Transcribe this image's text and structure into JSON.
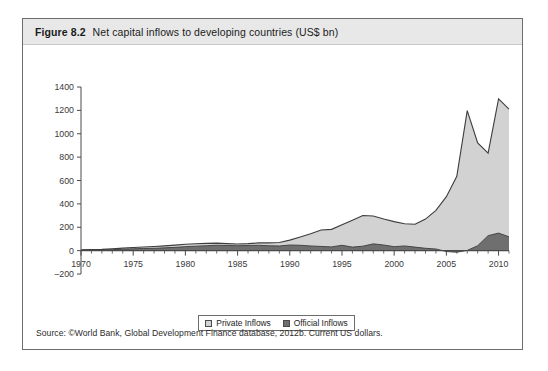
{
  "figure": {
    "number": "Figure 8.2",
    "caption": "Net capital inflows to developing countries (US$ bn)",
    "source": "Source: ©World Bank, Global Development Finance database, 2012b. Current US dollars."
  },
  "legend": {
    "items": [
      {
        "label": "Private Inflows",
        "color": "#d2d2d2"
      },
      {
        "label": "Official Inflows",
        "color": "#6f6f6f"
      }
    ]
  },
  "colors": {
    "private": "#d2d2d2",
    "official": "#6f6f6f",
    "line": "#3d3d3d",
    "axis": "#4a4a4a",
    "title_band": "#e8e8e8",
    "card_border": "#6d6d6d"
  },
  "chart_data": {
    "type": "area",
    "stacked": true,
    "title": "Net capital inflows to developing countries (US$ bn)",
    "xlabel": "",
    "ylabel": "",
    "xlim": [
      1970,
      2011
    ],
    "ylim": [
      -200,
      1400
    ],
    "ytick_step": 200,
    "xtick_step": 5,
    "xtick_minor_step": 1,
    "grid": false,
    "legend_position": "bottom-center",
    "yticks": [
      1400,
      1200,
      1000,
      800,
      600,
      400,
      200,
      0,
      -200
    ],
    "ytick_labels": [
      "1400",
      "1200",
      "1000",
      "800",
      "600",
      "400",
      "200",
      "0",
      "–200"
    ],
    "xticks": [
      1970,
      1975,
      1980,
      1985,
      1990,
      1995,
      2000,
      2005,
      2010
    ],
    "xtick_labels": [
      "1970",
      "1975",
      "1980",
      "1985",
      "1990",
      "1995",
      "2000",
      "2005",
      "2010"
    ],
    "x": [
      1970,
      1971,
      1972,
      1973,
      1974,
      1975,
      1976,
      1977,
      1978,
      1979,
      1980,
      1981,
      1982,
      1983,
      1984,
      1985,
      1986,
      1987,
      1988,
      1989,
      1990,
      1991,
      1992,
      1993,
      1994,
      1995,
      1996,
      1997,
      1998,
      1999,
      2000,
      2001,
      2002,
      2003,
      2004,
      2005,
      2006,
      2007,
      2008,
      2009,
      2010,
      2011
    ],
    "series": [
      {
        "name": "Official Inflows",
        "color": "#6f6f6f",
        "values": [
          4,
          5,
          6,
          8,
          12,
          16,
          18,
          20,
          24,
          28,
          34,
          38,
          42,
          46,
          44,
          42,
          44,
          46,
          42,
          40,
          48,
          46,
          40,
          36,
          32,
          46,
          30,
          38,
          58,
          48,
          34,
          40,
          30,
          20,
          14,
          -8,
          -14,
          2,
          42,
          128,
          150,
          118
        ]
      },
      {
        "name": "Private Inflows",
        "color": "#d2d2d2",
        "values": [
          3,
          4,
          5,
          7,
          9,
          11,
          13,
          15,
          17,
          19,
          20,
          21,
          20,
          18,
          16,
          15,
          16,
          20,
          24,
          30,
          42,
          70,
          104,
          140,
          150,
          176,
          230,
          262,
          238,
          222,
          214,
          190,
          196,
          250,
          330,
          470,
          650,
          1196,
          880,
          706,
          1148,
          1092
        ]
      }
    ],
    "annotations": [
      {
        "text": "peak 2007 ≈ 1200",
        "x": 2007,
        "y": 1200
      },
      {
        "text": "trough 2009 ≈ 700",
        "x": 2009,
        "y": 706
      },
      {
        "text": "local peak 1997 ≈ 300",
        "x": 1997,
        "y": 300
      }
    ]
  }
}
